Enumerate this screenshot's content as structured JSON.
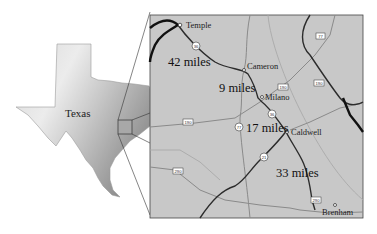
{
  "state_map": {
    "label": "Texas",
    "colors": {
      "relief_light": "#e6e6e6",
      "relief_mid": "#c4c4c4",
      "relief_dark": "#8a8a8a"
    }
  },
  "inset_map": {
    "background": "#c8c8c8",
    "border": "#333333",
    "cities": [
      {
        "name": "Temple"
      },
      {
        "name": "Cameron"
      },
      {
        "name": "Milano"
      },
      {
        "name": "Caldwell"
      },
      {
        "name": "Brenham"
      }
    ],
    "distances": [
      {
        "label": "42 miles"
      },
      {
        "label": "9 miles"
      },
      {
        "label": "17 miles"
      },
      {
        "label": "33 miles"
      }
    ],
    "route_shields": [
      {
        "number": "36"
      },
      {
        "number": "77"
      },
      {
        "number": "190"
      },
      {
        "number": "190"
      },
      {
        "number": "190"
      },
      {
        "number": "36"
      },
      {
        "number": "77"
      },
      {
        "number": "21"
      },
      {
        "number": "290"
      },
      {
        "number": "290"
      }
    ]
  }
}
